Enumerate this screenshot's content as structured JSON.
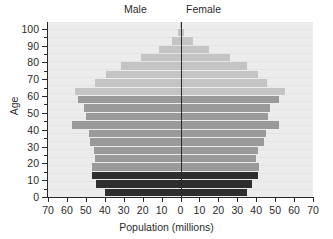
{
  "chart_data": {
    "type": "bar",
    "title": "",
    "subtitle": "",
    "xlabel": "Population (millions)",
    "ylabel": "Age",
    "left_series_label": "Male",
    "right_series_label": "Female",
    "xlim": [
      -70,
      70
    ],
    "ylim": [
      0,
      104
    ],
    "xticks": [
      70,
      60,
      50,
      40,
      30,
      20,
      10,
      0,
      10,
      20,
      30,
      40,
      50,
      60,
      70
    ],
    "yticks": [
      0,
      10,
      20,
      30,
      40,
      50,
      60,
      70,
      80,
      90,
      100
    ],
    "y_minor_ticks": [
      5,
      15,
      25,
      35,
      45,
      55,
      65,
      75,
      85,
      95
    ],
    "grid": false,
    "legend_position": "top",
    "bar_band_years": 5,
    "colors": {
      "children": "#2e2e2e",
      "working_age": "#9a9a9a",
      "elderly": "#c4c4c4",
      "plot_background": "#e9e9e9",
      "axis": "#2a2a2a",
      "text": "#2b2b2b"
    },
    "age_bands": [
      {
        "label": "0-4",
        "age_lo": 0,
        "age_hi": 5,
        "male": 40.0,
        "female": 35.0,
        "tier": "children"
      },
      {
        "label": "5-9",
        "age_lo": 5,
        "age_hi": 10,
        "male": 44.5,
        "female": 38.0,
        "tier": "children"
      },
      {
        "label": "10-14",
        "age_lo": 10,
        "age_hi": 15,
        "male": 46.5,
        "female": 41.0,
        "tier": "children"
      },
      {
        "label": "15-19",
        "age_lo": 15,
        "age_hi": 20,
        "male": 46.5,
        "female": 41.5,
        "tier": "working_age"
      },
      {
        "label": "20-24",
        "age_lo": 20,
        "age_hi": 25,
        "male": 45.0,
        "female": 40.0,
        "tier": "working_age"
      },
      {
        "label": "25-29",
        "age_lo": 25,
        "age_hi": 30,
        "male": 45.5,
        "female": 41.0,
        "tier": "working_age"
      },
      {
        "label": "30-34",
        "age_lo": 30,
        "age_hi": 35,
        "male": 48.0,
        "female": 44.0,
        "tier": "working_age"
      },
      {
        "label": "35-39",
        "age_lo": 35,
        "age_hi": 40,
        "male": 48.5,
        "female": 45.0,
        "tier": "working_age"
      },
      {
        "label": "40-44",
        "age_lo": 40,
        "age_hi": 45,
        "male": 57.5,
        "female": 52.0,
        "tier": "working_age"
      },
      {
        "label": "45-49",
        "age_lo": 45,
        "age_hi": 50,
        "male": 50.0,
        "female": 46.0,
        "tier": "working_age"
      },
      {
        "label": "50-54",
        "age_lo": 50,
        "age_hi": 55,
        "male": 51.0,
        "female": 47.5,
        "tier": "working_age"
      },
      {
        "label": "55-59",
        "age_lo": 55,
        "age_hi": 60,
        "male": 54.0,
        "female": 52.0,
        "tier": "working_age"
      },
      {
        "label": "60-64",
        "age_lo": 60,
        "age_hi": 65,
        "male": 55.5,
        "female": 55.0,
        "tier": "elderly"
      },
      {
        "label": "65-69",
        "age_lo": 65,
        "age_hi": 70,
        "male": 45.0,
        "female": 45.5,
        "tier": "elderly"
      },
      {
        "label": "70-74",
        "age_lo": 70,
        "age_hi": 75,
        "male": 39.5,
        "female": 41.0,
        "tier": "elderly"
      },
      {
        "label": "75-79",
        "age_lo": 75,
        "age_hi": 80,
        "male": 31.5,
        "female": 35.0,
        "tier": "elderly"
      },
      {
        "label": "80-84",
        "age_lo": 80,
        "age_hi": 85,
        "male": 21.0,
        "female": 26.0,
        "tier": "elderly"
      },
      {
        "label": "85-89",
        "age_lo": 85,
        "age_hi": 90,
        "male": 11.5,
        "female": 15.0,
        "tier": "elderly"
      },
      {
        "label": "90-94",
        "age_lo": 90,
        "age_hi": 95,
        "male": 4.5,
        "female": 6.5,
        "tier": "elderly"
      },
      {
        "label": "95-99",
        "age_lo": 95,
        "age_hi": 100,
        "male": 1.2,
        "female": 2.0,
        "tier": "elderly"
      },
      {
        "label": "100+",
        "age_lo": 100,
        "age_hi": 104,
        "male": 0.3,
        "female": 0.5,
        "tier": "elderly"
      }
    ]
  }
}
